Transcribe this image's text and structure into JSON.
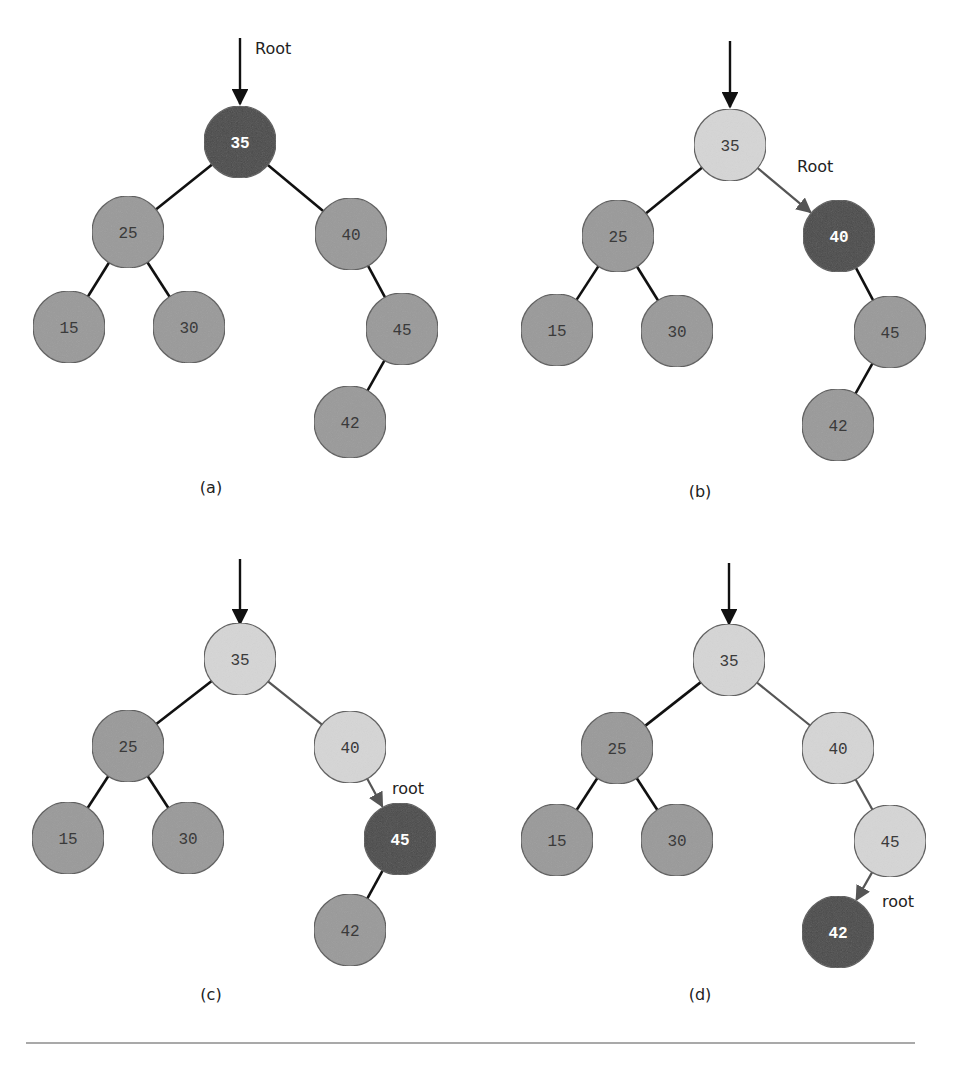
{
  "figure": {
    "node_radius": 36,
    "colors": {
      "current": "#4a4a4a",
      "visited": "#d6d6d6",
      "unvisited": "#9a9a9a",
      "current_text": "#ffffff",
      "other_text": "#3a3a3a",
      "edge": "#111111",
      "path_edge": "#555555",
      "separator": "#555555"
    },
    "edges": [
      [
        "35",
        "25"
      ],
      [
        "35",
        "40"
      ],
      [
        "25",
        "15"
      ],
      [
        "25",
        "30"
      ],
      [
        "40",
        "45"
      ],
      [
        "45",
        "42"
      ]
    ],
    "panels": [
      {
        "id": "a",
        "caption": "(a)",
        "caption_pos": [
          211,
          493
        ],
        "entry_arrow": {
          "x": 240,
          "y1": 38,
          "y2": 104
        },
        "pointer_label": {
          "text": "Root",
          "x": 255,
          "y": 54
        },
        "pointer_arrow": null,
        "nodes": [
          {
            "key": "35",
            "x": 240,
            "y": 142,
            "state": "current"
          },
          {
            "key": "25",
            "x": 128,
            "y": 232,
            "state": "unvisited"
          },
          {
            "key": "40",
            "x": 351,
            "y": 234,
            "state": "unvisited"
          },
          {
            "key": "15",
            "x": 69,
            "y": 327,
            "state": "unvisited"
          },
          {
            "key": "30",
            "x": 189,
            "y": 327,
            "state": "unvisited"
          },
          {
            "key": "45",
            "x": 402,
            "y": 329,
            "state": "unvisited"
          },
          {
            "key": "42",
            "x": 350,
            "y": 422,
            "state": "unvisited"
          }
        ],
        "path_edges": []
      },
      {
        "id": "b",
        "caption": "(b)",
        "caption_pos": [
          700,
          497
        ],
        "entry_arrow": {
          "x": 730,
          "y1": 41,
          "y2": 107
        },
        "pointer_label": {
          "text": "Root",
          "x": 797,
          "y": 172
        },
        "pointer_arrow": {
          "from": "35",
          "to": "40"
        },
        "nodes": [
          {
            "key": "35",
            "x": 730,
            "y": 145,
            "state": "visited"
          },
          {
            "key": "25",
            "x": 618,
            "y": 236,
            "state": "unvisited"
          },
          {
            "key": "40",
            "x": 839,
            "y": 236,
            "state": "current"
          },
          {
            "key": "15",
            "x": 557,
            "y": 330,
            "state": "unvisited"
          },
          {
            "key": "30",
            "x": 677,
            "y": 331,
            "state": "unvisited"
          },
          {
            "key": "45",
            "x": 890,
            "y": 332,
            "state": "unvisited"
          },
          {
            "key": "42",
            "x": 838,
            "y": 425,
            "state": "unvisited"
          }
        ],
        "path_edges": [
          [
            "35",
            "40"
          ]
        ]
      },
      {
        "id": "c",
        "caption": "(c)",
        "caption_pos": [
          211,
          1000
        ],
        "entry_arrow": {
          "x": 240,
          "y1": 559,
          "y2": 624
        },
        "pointer_label": {
          "text": "root",
          "x": 392,
          "y": 794
        },
        "pointer_arrow": {
          "from": "40",
          "to": "45"
        },
        "nodes": [
          {
            "key": "35",
            "x": 240,
            "y": 659,
            "state": "visited"
          },
          {
            "key": "25",
            "x": 128,
            "y": 746,
            "state": "unvisited"
          },
          {
            "key": "40",
            "x": 350,
            "y": 747,
            "state": "visited"
          },
          {
            "key": "15",
            "x": 68,
            "y": 838,
            "state": "unvisited"
          },
          {
            "key": "30",
            "x": 188,
            "y": 838,
            "state": "unvisited"
          },
          {
            "key": "45",
            "x": 400,
            "y": 839,
            "state": "current"
          },
          {
            "key": "42",
            "x": 350,
            "y": 930,
            "state": "unvisited"
          }
        ],
        "path_edges": [
          [
            "35",
            "40"
          ],
          [
            "40",
            "45"
          ]
        ]
      },
      {
        "id": "d",
        "caption": "(d)",
        "caption_pos": [
          700,
          1000
        ],
        "entry_arrow": {
          "x": 729,
          "y1": 563,
          "y2": 624
        },
        "pointer_label": {
          "text": "root",
          "x": 882,
          "y": 907
        },
        "pointer_arrow": {
          "from": "45",
          "to": "42"
        },
        "nodes": [
          {
            "key": "35",
            "x": 729,
            "y": 660,
            "state": "visited"
          },
          {
            "key": "25",
            "x": 617,
            "y": 748,
            "state": "unvisited"
          },
          {
            "key": "40",
            "x": 838,
            "y": 748,
            "state": "visited"
          },
          {
            "key": "15",
            "x": 557,
            "y": 840,
            "state": "unvisited"
          },
          {
            "key": "30",
            "x": 677,
            "y": 840,
            "state": "unvisited"
          },
          {
            "key": "45",
            "x": 890,
            "y": 841,
            "state": "visited"
          },
          {
            "key": "42",
            "x": 838,
            "y": 932,
            "state": "current"
          }
        ],
        "path_edges": [
          [
            "35",
            "40"
          ],
          [
            "40",
            "45"
          ],
          [
            "45",
            "42"
          ]
        ]
      }
    ],
    "separator": {
      "x1": 26,
      "x2": 915,
      "y": 1043
    }
  }
}
